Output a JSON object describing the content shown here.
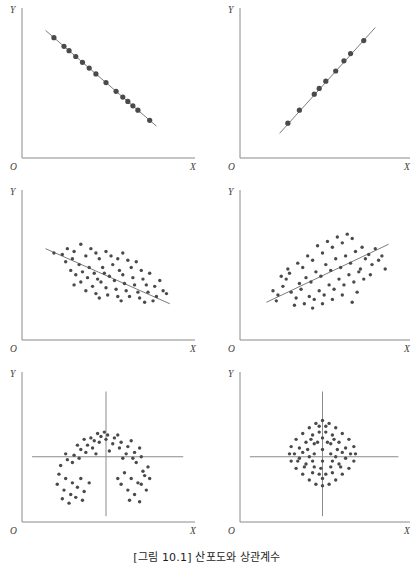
{
  "figure": {
    "caption": "[그림 10.1] 산포도와 상관계수",
    "axis_labels": {
      "y": "Y",
      "x": "X",
      "origin": "O"
    },
    "colors": {
      "axis": "#8a8a8a",
      "dot": "#4a4a4a",
      "trend_line": "#6d6d6d",
      "caption_text": "#1c1c1c",
      "background": "#ffffff"
    }
  },
  "chart_data": [
    {
      "type": "scatter",
      "title": "",
      "panel": "top-left",
      "description": "Perfect negative correlation",
      "xlabel": "X",
      "ylabel": "Y",
      "xlim": [
        0,
        100
      ],
      "ylim": [
        0,
        100
      ],
      "grid": false,
      "legend": "none",
      "trend_line": {
        "x0": 14,
        "y0": 88,
        "x1": 80,
        "y1": 22
      },
      "points": [
        [
          19,
          83
        ],
        [
          25,
          77
        ],
        [
          28,
          74
        ],
        [
          32,
          70
        ],
        [
          36,
          66
        ],
        [
          40,
          62
        ],
        [
          44,
          58
        ],
        [
          50,
          52
        ],
        [
          56,
          46
        ],
        [
          60,
          42
        ],
        [
          63,
          39
        ],
        [
          66,
          36
        ],
        [
          69,
          33
        ],
        [
          76,
          26
        ]
      ]
    },
    {
      "type": "scatter",
      "title": "",
      "panel": "top-right",
      "description": "Perfect positive correlation",
      "xlabel": "X",
      "ylabel": "Y",
      "xlim": [
        0,
        100
      ],
      "ylim": [
        0,
        100
      ],
      "grid": false,
      "legend": "none",
      "trend_line": {
        "x0": 24,
        "y0": 17,
        "x1": 82,
        "y1": 90
      },
      "points": [
        [
          29,
          24
        ],
        [
          36,
          33
        ],
        [
          45,
          44
        ],
        [
          48,
          48
        ],
        [
          52,
          53
        ],
        [
          58,
          60
        ],
        [
          63,
          67
        ],
        [
          67,
          72
        ],
        [
          75,
          81
        ]
      ]
    },
    {
      "type": "scatter",
      "title": "",
      "panel": "middle-left",
      "description": "Moderate negative correlation",
      "xlabel": "X",
      "ylabel": "Y",
      "xlim": [
        0,
        100
      ],
      "ylim": [
        0,
        100
      ],
      "grid": false,
      "legend": "none",
      "trend_line": {
        "x0": 14,
        "y0": 63,
        "x1": 88,
        "y1": 25
      },
      "points": [
        [
          19,
          60
        ],
        [
          24,
          59
        ],
        [
          27,
          63
        ],
        [
          30,
          56
        ],
        [
          26,
          54
        ],
        [
          31,
          61
        ],
        [
          35,
          66
        ],
        [
          34,
          52
        ],
        [
          38,
          58
        ],
        [
          41,
          63
        ],
        [
          44,
          60
        ],
        [
          40,
          50
        ],
        [
          36,
          47
        ],
        [
          32,
          45
        ],
        [
          29,
          48
        ],
        [
          46,
          56
        ],
        [
          50,
          61
        ],
        [
          53,
          58
        ],
        [
          48,
          50
        ],
        [
          43,
          46
        ],
        [
          39,
          43
        ],
        [
          35,
          40
        ],
        [
          31,
          38
        ],
        [
          45,
          42
        ],
        [
          49,
          46
        ],
        [
          54,
          52
        ],
        [
          57,
          56
        ],
        [
          60,
          60
        ],
        [
          63,
          55
        ],
        [
          58,
          48
        ],
        [
          52,
          44
        ],
        [
          47,
          40
        ],
        [
          42,
          37
        ],
        [
          38,
          34
        ],
        [
          44,
          32
        ],
        [
          50,
          36
        ],
        [
          55,
          41
        ],
        [
          60,
          45
        ],
        [
          65,
          50
        ],
        [
          68,
          54
        ],
        [
          71,
          48
        ],
        [
          66,
          43
        ],
        [
          61,
          39
        ],
        [
          56,
          35
        ],
        [
          51,
          31
        ],
        [
          46,
          29
        ],
        [
          57,
          30
        ],
        [
          62,
          34
        ],
        [
          67,
          38
        ],
        [
          72,
          42
        ],
        [
          76,
          46
        ],
        [
          74,
          38
        ],
        [
          69,
          33
        ],
        [
          64,
          30
        ],
        [
          59,
          27
        ],
        [
          70,
          29
        ],
        [
          75,
          33
        ],
        [
          79,
          37
        ],
        [
          82,
          41
        ],
        [
          84,
          34
        ],
        [
          80,
          30
        ],
        [
          86,
          32
        ],
        [
          78,
          27
        ],
        [
          73,
          26
        ]
      ]
    },
    {
      "type": "scatter",
      "title": "",
      "panel": "middle-right",
      "description": "Moderate positive correlation",
      "xlabel": "X",
      "ylabel": "Y",
      "xlim": [
        0,
        100
      ],
      "ylim": [
        0,
        100
      ],
      "grid": false,
      "legend": "none",
      "trend_line": {
        "x0": 16,
        "y0": 26,
        "x1": 90,
        "y1": 66
      },
      "points": [
        [
          20,
          34
        ],
        [
          23,
          31
        ],
        [
          26,
          37
        ],
        [
          22,
          27
        ],
        [
          28,
          42
        ],
        [
          31,
          33
        ],
        [
          34,
          29
        ],
        [
          30,
          46
        ],
        [
          36,
          39
        ],
        [
          33,
          24
        ],
        [
          38,
          50
        ],
        [
          40,
          43
        ],
        [
          37,
          35
        ],
        [
          42,
          30
        ],
        [
          39,
          25
        ],
        [
          44,
          55
        ],
        [
          46,
          47
        ],
        [
          43,
          40
        ],
        [
          48,
          34
        ],
        [
          45,
          28
        ],
        [
          50,
          60
        ],
        [
          52,
          52
        ],
        [
          49,
          44
        ],
        [
          54,
          38
        ],
        [
          51,
          31
        ],
        [
          56,
          64
        ],
        [
          58,
          56
        ],
        [
          55,
          48
        ],
        [
          60,
          42
        ],
        [
          57,
          35
        ],
        [
          62,
          67
        ],
        [
          64,
          58
        ],
        [
          61,
          50
        ],
        [
          66,
          45
        ],
        [
          63,
          38
        ],
        [
          68,
          70
        ],
        [
          70,
          61
        ],
        [
          67,
          53
        ],
        [
          72,
          47
        ],
        [
          69,
          40
        ],
        [
          74,
          64
        ],
        [
          76,
          56
        ],
        [
          73,
          49
        ],
        [
          78,
          59
        ],
        [
          80,
          52
        ],
        [
          82,
          63
        ],
        [
          84,
          55
        ],
        [
          79,
          45
        ],
        [
          75,
          42
        ],
        [
          71,
          33
        ],
        [
          47,
          65
        ],
        [
          53,
          68
        ],
        [
          59,
          71
        ],
        [
          41,
          58
        ],
        [
          35,
          53
        ],
        [
          29,
          49
        ],
        [
          25,
          44
        ],
        [
          65,
          73
        ],
        [
          86,
          58
        ],
        [
          88,
          49
        ],
        [
          44,
          22
        ],
        [
          50,
          25
        ],
        [
          56,
          28
        ],
        [
          62,
          31
        ],
        [
          68,
          26
        ]
      ]
    },
    {
      "type": "scatter",
      "title": "",
      "panel": "bottom-left",
      "description": "Curvilinear relationship, zero linear correlation",
      "xlabel": "X",
      "ylabel": "Y",
      "xlim": [
        0,
        100
      ],
      "ylim": [
        0,
        100
      ],
      "grid": false,
      "legend": "none",
      "cross_axes": {
        "vertical_x": 50,
        "horizontal_y": 45
      },
      "points": [
        [
          22,
          33
        ],
        [
          26,
          30
        ],
        [
          30,
          27
        ],
        [
          25,
          22
        ],
        [
          29,
          19
        ],
        [
          21,
          26
        ],
        [
          33,
          24
        ],
        [
          35,
          30
        ],
        [
          32,
          17
        ],
        [
          37,
          21
        ],
        [
          24,
          16
        ],
        [
          28,
          13
        ],
        [
          36,
          15
        ],
        [
          40,
          27
        ],
        [
          23,
          39
        ],
        [
          27,
          43
        ],
        [
          31,
          46
        ],
        [
          35,
          50
        ],
        [
          39,
          53
        ],
        [
          43,
          56
        ],
        [
          47,
          59
        ],
        [
          51,
          60
        ],
        [
          55,
          58
        ],
        [
          59,
          55
        ],
        [
          63,
          52
        ],
        [
          67,
          48
        ],
        [
          71,
          45
        ],
        [
          30,
          41
        ],
        [
          34,
          44
        ],
        [
          38,
          48
        ],
        [
          42,
          51
        ],
        [
          46,
          55
        ],
        [
          50,
          57
        ],
        [
          54,
          54
        ],
        [
          58,
          51
        ],
        [
          62,
          47
        ],
        [
          66,
          44
        ],
        [
          26,
          47
        ],
        [
          33,
          53
        ],
        [
          41,
          58
        ],
        [
          49,
          62
        ],
        [
          57,
          60
        ],
        [
          65,
          56
        ],
        [
          70,
          51
        ],
        [
          45,
          61
        ],
        [
          37,
          57
        ],
        [
          44,
          47
        ],
        [
          52,
          49
        ],
        [
          60,
          44
        ],
        [
          68,
          41
        ],
        [
          61,
          34
        ],
        [
          65,
          30
        ],
        [
          69,
          27
        ],
        [
          63,
          22
        ],
        [
          67,
          19
        ],
        [
          71,
          26
        ],
        [
          73,
          32
        ],
        [
          75,
          38
        ],
        [
          59,
          26
        ],
        [
          64,
          15
        ],
        [
          70,
          14
        ],
        [
          74,
          22
        ],
        [
          57,
          30
        ],
        [
          72,
          35
        ],
        [
          76,
          30
        ]
      ]
    },
    {
      "type": "scatter",
      "title": "",
      "panel": "bottom-right",
      "description": "No correlation, circular cloud",
      "xlabel": "X",
      "ylabel": "Y",
      "xlim": [
        0,
        100
      ],
      "ylim": [
        0,
        100
      ],
      "grid": false,
      "legend": "none",
      "cross_axes": {
        "vertical_x": 50,
        "horizontal_y": 45
      },
      "points": [
        [
          50,
          70
        ],
        [
          46,
          68
        ],
        [
          54,
          68
        ],
        [
          42,
          65
        ],
        [
          58,
          65
        ],
        [
          38,
          61
        ],
        [
          62,
          61
        ],
        [
          34,
          57
        ],
        [
          66,
          57
        ],
        [
          31,
          52
        ],
        [
          69,
          52
        ],
        [
          30,
          47
        ],
        [
          70,
          47
        ],
        [
          31,
          42
        ],
        [
          69,
          42
        ],
        [
          34,
          37
        ],
        [
          66,
          37
        ],
        [
          38,
          33
        ],
        [
          62,
          33
        ],
        [
          42,
          29
        ],
        [
          58,
          29
        ],
        [
          46,
          26
        ],
        [
          54,
          26
        ],
        [
          50,
          25
        ],
        [
          44,
          60
        ],
        [
          56,
          60
        ],
        [
          40,
          55
        ],
        [
          60,
          55
        ],
        [
          38,
          48
        ],
        [
          62,
          48
        ],
        [
          40,
          40
        ],
        [
          60,
          40
        ],
        [
          44,
          34
        ],
        [
          56,
          34
        ],
        [
          48,
          62
        ],
        [
          52,
          62
        ],
        [
          36,
          51
        ],
        [
          64,
          51
        ],
        [
          36,
          44
        ],
        [
          64,
          44
        ],
        [
          42,
          45
        ],
        [
          58,
          45
        ],
        [
          50,
          58
        ],
        [
          50,
          50
        ],
        [
          50,
          42
        ],
        [
          45,
          54
        ],
        [
          55,
          54
        ],
        [
          45,
          47
        ],
        [
          55,
          47
        ],
        [
          45,
          38
        ],
        [
          55,
          38
        ],
        [
          48,
          33
        ],
        [
          52,
          33
        ],
        [
          48,
          66
        ],
        [
          52,
          66
        ],
        [
          41,
          50
        ],
        [
          59,
          50
        ],
        [
          33,
          47
        ],
        [
          67,
          47
        ],
        [
          50,
          30
        ],
        [
          44,
          42
        ],
        [
          56,
          42
        ],
        [
          47,
          55
        ],
        [
          53,
          55
        ],
        [
          49,
          37
        ],
        [
          43,
          57
        ],
        [
          57,
          57
        ],
        [
          39,
          38
        ],
        [
          61,
          38
        ],
        [
          35,
          42
        ]
      ]
    }
  ]
}
